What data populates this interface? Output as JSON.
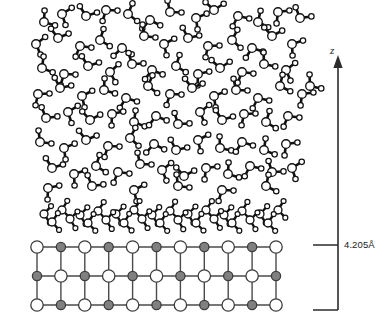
{
  "figure": {
    "background_color": "#ffffff"
  },
  "axis": {
    "z_label": "z",
    "arrow_direction": "up",
    "arrow_x": 338,
    "arrow_tip_y": 55,
    "arrow_base_y": 310,
    "label_x": 330,
    "label_y": 44
  },
  "dimension": {
    "value_label": "4.205Å",
    "value": 4.205,
    "unit": "Å",
    "label_x": 344,
    "label_y": 239,
    "tick_top_y": 245,
    "tick_bottom_y": 310,
    "tick_left_x": 313,
    "tick_right_x": 338
  },
  "colors": {
    "bond": "#111111",
    "atom_outline": "#111111",
    "oxygen_fill": "#ffffff",
    "hydrogen_fill": "#ffffff",
    "lattice_line": "#4a4a4a",
    "ion_a_fill": "#ffffff",
    "ion_b_fill": "#808080",
    "ion_outline": "#3c3c3c",
    "axis_line": "#2b2b2b",
    "text": "#1a1a1a"
  },
  "lattice": {
    "name": "ionic-crystal-substrate",
    "columns": 11,
    "rows": 3,
    "x_start": 37,
    "x_step": 23.9,
    "y_start": 247,
    "y_step": 29,
    "ion_radius_a": 6.2,
    "ion_radius_b": 4.6,
    "line_width": 1.4,
    "description": "Alternating cation/anion square lattice, 11 columns by 3 rows"
  },
  "chart_data": {
    "type": "scatter",
    "xlabel": "",
    "ylabel": "z",
    "regions": [
      {
        "name": "bulk-liquid",
        "y_range": [
          5,
          195
        ],
        "description": "Disordered bulk water molecules"
      },
      {
        "name": "adsorbed-monolayer",
        "y_range": [
          200,
          232
        ],
        "description": "Ordered flat-lying adsorbed water layer"
      },
      {
        "name": "crystal-substrate",
        "y_range": [
          247,
          305
        ],
        "description": "Ionic crystal lattice"
      }
    ],
    "molecule_geometry": {
      "oxygen_radius": 4.3,
      "hydrogen_radius": 2.7,
      "bond_length": 11.5,
      "hoh_angle_deg": 104.5,
      "bond_width": 2.6
    },
    "bulk_molecules": [
      [
        44,
        22,
        -35
      ],
      [
        62,
        14,
        20
      ],
      [
        86,
        16,
        -70
      ],
      [
        106,
        10,
        55
      ],
      [
        128,
        14,
        -15
      ],
      [
        150,
        20,
        80
      ],
      [
        170,
        12,
        -50
      ],
      [
        196,
        18,
        30
      ],
      [
        214,
        10,
        -85
      ],
      [
        238,
        16,
        65
      ],
      [
        258,
        22,
        -25
      ],
      [
        278,
        12,
        45
      ],
      [
        300,
        18,
        -60
      ],
      [
        36,
        44,
        15
      ],
      [
        58,
        38,
        -75
      ],
      [
        80,
        46,
        60
      ],
      [
        100,
        40,
        -20
      ],
      [
        122,
        48,
        85
      ],
      [
        144,
        36,
        -45
      ],
      [
        164,
        44,
        25
      ],
      [
        188,
        38,
        -65
      ],
      [
        208,
        46,
        50
      ],
      [
        232,
        40,
        -10
      ],
      [
        252,
        48,
        70
      ],
      [
        272,
        36,
        -80
      ],
      [
        292,
        44,
        35
      ],
      [
        42,
        68,
        -30
      ],
      [
        64,
        74,
        55
      ],
      [
        88,
        66,
        -70
      ],
      [
        110,
        72,
        10
      ],
      [
        132,
        64,
        -55
      ],
      [
        152,
        70,
        75
      ],
      [
        176,
        66,
        -20
      ],
      [
        198,
        74,
        40
      ],
      [
        220,
        68,
        -85
      ],
      [
        242,
        72,
        60
      ],
      [
        264,
        64,
        -40
      ],
      [
        286,
        70,
        15
      ],
      [
        38,
        94,
        50
      ],
      [
        60,
        88,
        -65
      ],
      [
        82,
        96,
        25
      ],
      [
        104,
        90,
        -35
      ],
      [
        126,
        98,
        70
      ],
      [
        148,
        86,
        -15
      ],
      [
        170,
        94,
        55
      ],
      [
        192,
        88,
        -75
      ],
      [
        214,
        96,
        30
      ],
      [
        236,
        90,
        -50
      ],
      [
        258,
        98,
        65
      ],
      [
        280,
        86,
        -25
      ],
      [
        302,
        94,
        45
      ],
      [
        46,
        118,
        -60
      ],
      [
        68,
        112,
        20
      ],
      [
        90,
        120,
        -80
      ],
      [
        112,
        114,
        40
      ],
      [
        134,
        122,
        -30
      ],
      [
        156,
        116,
        75
      ],
      [
        178,
        124,
        -55
      ],
      [
        200,
        112,
        15
      ],
      [
        222,
        120,
        -70
      ],
      [
        244,
        114,
        50
      ],
      [
        266,
        122,
        -20
      ],
      [
        288,
        116,
        60
      ],
      [
        40,
        142,
        -45
      ],
      [
        64,
        148,
        30
      ],
      [
        86,
        140,
        -75
      ],
      [
        108,
        146,
        55
      ],
      [
        130,
        138,
        -10
      ],
      [
        154,
        144,
        80
      ],
      [
        176,
        150,
        -65
      ],
      [
        198,
        140,
        25
      ],
      [
        220,
        148,
        -40
      ],
      [
        242,
        142,
        70
      ],
      [
        264,
        150,
        -30
      ],
      [
        286,
        144,
        45
      ],
      [
        52,
        168,
        -70
      ],
      [
        74,
        174,
        35
      ],
      [
        96,
        166,
        -20
      ],
      [
        118,
        172,
        60
      ],
      [
        140,
        164,
        -50
      ],
      [
        162,
        170,
        15
      ],
      [
        184,
        176,
        -80
      ],
      [
        206,
        168,
        45
      ],
      [
        228,
        174,
        -35
      ],
      [
        250,
        166,
        65
      ],
      [
        272,
        172,
        -55
      ],
      [
        292,
        168,
        20
      ],
      [
        48,
        188,
        40
      ],
      [
        92,
        186,
        -60
      ],
      [
        134,
        190,
        25
      ],
      [
        178,
        186,
        -45
      ],
      [
        222,
        190,
        55
      ],
      [
        266,
        186,
        -25
      ],
      [
        310,
        86,
        -40
      ]
    ],
    "monolayer_molecules": [
      [
        44,
        214,
        4
      ],
      [
        62,
        210,
        -8
      ],
      [
        80,
        215,
        6
      ],
      [
        98,
        211,
        -5
      ],
      [
        116,
        214,
        8
      ],
      [
        134,
        210,
        -6
      ],
      [
        152,
        215,
        5
      ],
      [
        170,
        211,
        -9
      ],
      [
        188,
        214,
        7
      ],
      [
        206,
        210,
        -4
      ],
      [
        224,
        215,
        6
      ],
      [
        242,
        211,
        -7
      ],
      [
        260,
        214,
        5
      ],
      [
        278,
        210,
        -6
      ],
      [
        52,
        222,
        -4
      ],
      [
        70,
        219,
        7
      ],
      [
        88,
        223,
        -6
      ],
      [
        106,
        220,
        5
      ],
      [
        124,
        223,
        -8
      ],
      [
        142,
        219,
        6
      ],
      [
        160,
        223,
        -5
      ],
      [
        178,
        220,
        8
      ],
      [
        196,
        223,
        -7
      ],
      [
        214,
        219,
        4
      ],
      [
        232,
        223,
        -6
      ],
      [
        250,
        220,
        7
      ],
      [
        268,
        223,
        -5
      ]
    ]
  }
}
